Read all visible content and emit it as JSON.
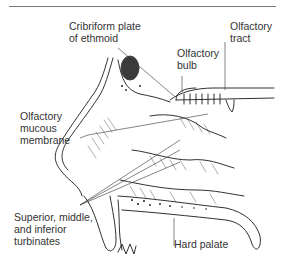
{
  "diagram": {
    "labels": [
      {
        "id": "cribriform",
        "lines": [
          "Cribriform plate",
          "of ethmoid"
        ]
      },
      {
        "id": "olf_tract",
        "lines": [
          "Olfactory",
          "tract"
        ]
      },
      {
        "id": "olf_bulb",
        "lines": [
          "Olfactory",
          "bulb"
        ]
      },
      {
        "id": "olf_mucous",
        "lines": [
          "Olfactory",
          "mucous",
          "membrane"
        ]
      },
      {
        "id": "turbinates",
        "lines": [
          "Superior, middle,",
          "and inferior",
          "turbinates"
        ]
      },
      {
        "id": "hard_palate",
        "lines": [
          "Hard palate"
        ]
      }
    ],
    "colors": {
      "line": "#1a1a1a",
      "text": "#333333",
      "rule": "#7a7a7a",
      "background": "#ffffff"
    }
  }
}
